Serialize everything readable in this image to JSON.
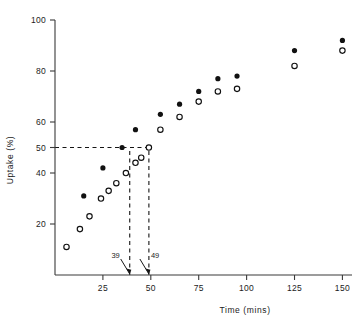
{
  "chart_data": {
    "type": "scatter",
    "title": "",
    "xlabel": "Time (mins)",
    "ylabel": "Uptake (%)",
    "xlim": [
      0,
      155
    ],
    "ylim": [
      0,
      100
    ],
    "xticks": [
      25,
      50,
      75,
      100,
      125,
      150
    ],
    "yticks": [
      20,
      40,
      50,
      60,
      80,
      100
    ],
    "grid": false,
    "legend": "none",
    "series": [
      {
        "name": "filled",
        "marker": "filled-circle",
        "points": [
          {
            "x": 15,
            "y": 31
          },
          {
            "x": 25,
            "y": 42
          },
          {
            "x": 35,
            "y": 50
          },
          {
            "x": 42,
            "y": 57
          },
          {
            "x": 55,
            "y": 63
          },
          {
            "x": 65,
            "y": 67
          },
          {
            "x": 75,
            "y": 72
          },
          {
            "x": 85,
            "y": 77
          },
          {
            "x": 95,
            "y": 78
          },
          {
            "x": 125,
            "y": 88
          },
          {
            "x": 150,
            "y": 92
          }
        ]
      },
      {
        "name": "open",
        "marker": "open-circle",
        "points": [
          {
            "x": 6,
            "y": 11
          },
          {
            "x": 13,
            "y": 18
          },
          {
            "x": 18,
            "y": 23
          },
          {
            "x": 24,
            "y": 30
          },
          {
            "x": 28,
            "y": 33
          },
          {
            "x": 32,
            "y": 36
          },
          {
            "x": 37,
            "y": 40
          },
          {
            "x": 42,
            "y": 44
          },
          {
            "x": 45,
            "y": 46
          },
          {
            "x": 49,
            "y": 50
          },
          {
            "x": 55,
            "y": 57
          },
          {
            "x": 65,
            "y": 62
          },
          {
            "x": 75,
            "y": 68
          },
          {
            "x": 85,
            "y": 72
          },
          {
            "x": 95,
            "y": 73
          },
          {
            "x": 125,
            "y": 82
          },
          {
            "x": 150,
            "y": 88
          }
        ]
      }
    ],
    "annotations": [
      {
        "label": "39",
        "x": 39,
        "kind": "arrow-down-axis"
      },
      {
        "label": "49",
        "x": 49,
        "kind": "arrow-down-axis"
      }
    ],
    "guides": [
      {
        "kind": "horizontal-dashed",
        "y": 50,
        "from_x": 0,
        "to_x": 49
      },
      {
        "kind": "vertical-dashed",
        "x": 39,
        "from_y": 0,
        "to_y": 50
      },
      {
        "kind": "vertical-dashed",
        "x": 49,
        "from_y": 0,
        "to_y": 50
      }
    ]
  }
}
